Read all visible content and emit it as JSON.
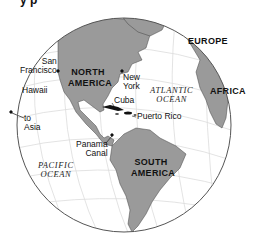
{
  "map": {
    "title_fragment": "y         p",
    "colors": {
      "land": "#9a9a9a",
      "water": "#ffffff",
      "graticule": "#dcdcdc",
      "outline": "#555555",
      "caribbean_islands": "#111111"
    },
    "regions": {
      "north_america": "NORTH AMERICA",
      "south_america": "SOUTH AMERICA",
      "europe": "EUROPE",
      "africa": "AFRICA"
    },
    "oceans": {
      "atlantic_line1": "ATLANTIC",
      "atlantic_line2": "OCEAN",
      "pacific_line1": "PACIFIC",
      "pacific_line2": "OCEAN"
    },
    "places": {
      "san_francisco_line1": "San",
      "san_francisco_line2": "Francisco",
      "new_york_line1": "New",
      "new_york_line2": "York",
      "hawaii": "Hawaii",
      "to_asia_line1": "to",
      "to_asia_line2": "Asia",
      "cuba": "Cuba",
      "puerto_rico": "Puerto Rico",
      "panama_line1": "Panama",
      "panama_line2": "Canal"
    }
  }
}
